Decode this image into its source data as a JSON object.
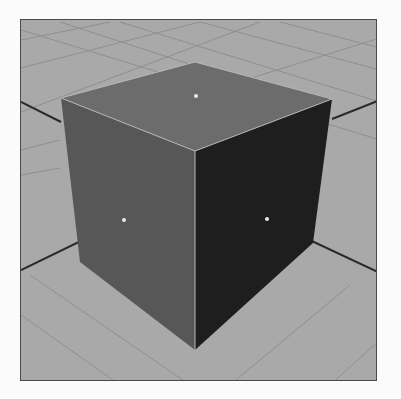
{
  "scene": {
    "label": "3D viewport - cube on grid",
    "object": "cube",
    "colors": {
      "background": "#a9a9a9",
      "grid_line": "#8f8f8f",
      "top_face": "#6c6c6c",
      "left_face": "#575757",
      "right_face": "#1e1e1e",
      "edge_highlight": "#b8b8b8",
      "axis_line": "#2a2a2a",
      "face_center_dot": "#e8e8e8",
      "frame_border": "#4a4a4a"
    },
    "face_center_markers": [
      "top",
      "left",
      "right"
    ]
  }
}
